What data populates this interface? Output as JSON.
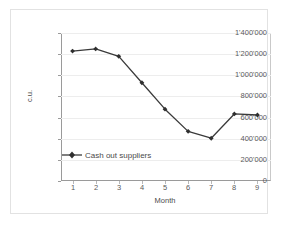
{
  "chart_data": {
    "type": "line",
    "title": "",
    "xlabel": "Month",
    "ylabel": "c.u.",
    "categories": [
      "1",
      "2",
      "3",
      "4",
      "5",
      "6",
      "7",
      "8",
      "9"
    ],
    "x": [
      1,
      2,
      3,
      4,
      5,
      6,
      7,
      8,
      9
    ],
    "series": [
      {
        "name": "Cash out suppliers",
        "values": [
          1220000,
          1240000,
          1170000,
          920000,
          670000,
          460000,
          395000,
          625000,
          615000
        ],
        "color": "#3a3a3a",
        "marker": "diamond"
      }
    ],
    "ylim": [
      0,
      1400000
    ],
    "yticks": [
      0,
      200000,
      400000,
      600000,
      800000,
      1000000,
      1200000,
      1400000
    ],
    "ytick_labels": [
      "0",
      "200'000",
      "400'000",
      "600'000",
      "800'000",
      "1'000'000",
      "1'200'000",
      "1'400'000"
    ],
    "xtick_labels": [
      "1",
      "2",
      "3",
      "4",
      "5",
      "6",
      "7",
      "8",
      "9"
    ],
    "grid": true,
    "grid_axis": "y",
    "legend": {
      "position": "inside-bottom-left",
      "entries": [
        "Cash out suppliers"
      ]
    },
    "colors": {
      "line": "#3a3a3a",
      "grid": "#ededed",
      "axis": "#9a9a9a",
      "frame": "#e2e2e2",
      "text": "#4a4a4a",
      "background": "#ffffff"
    }
  }
}
